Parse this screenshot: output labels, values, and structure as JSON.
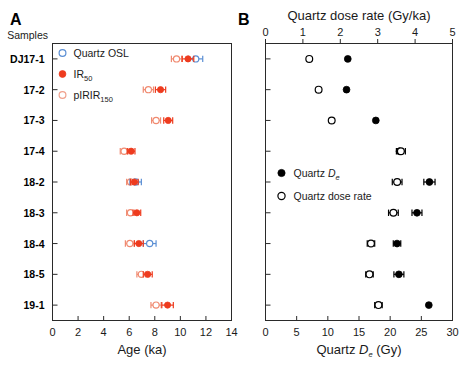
{
  "figure": {
    "width": 467,
    "height": 369,
    "background": "#ffffff"
  },
  "panelA": {
    "letter": "A",
    "samples_header": "Samples",
    "xlabel": "Age (ka)",
    "xticks": [
      "0",
      "2",
      "4",
      "6",
      "8",
      "10",
      "12",
      "14"
    ],
    "xtick_values": [
      0,
      2,
      4,
      6,
      8,
      10,
      12,
      14
    ],
    "xlim": [
      0,
      14
    ],
    "categories": [
      "DJ17-1",
      "17-2",
      "17-3",
      "17-4",
      "18-2",
      "18-3",
      "18-4",
      "18-5",
      "19-1"
    ],
    "legend": [
      {
        "label": "Quartz OSL",
        "marker": "open-circle",
        "color": "#5b8fd4"
      },
      {
        "label": "IR",
        "sub": "50",
        "marker": "filled-circle",
        "color": "#ee3b1e"
      },
      {
        "label": "pIRIR",
        "sub": "150",
        "marker": "open-circle",
        "color": "#f0a08c"
      }
    ],
    "colors": {
      "quartz_osl": "#5b8fd4",
      "ir50": "#ee3b1e",
      "pirir150": "#f08a70"
    }
  },
  "panelB": {
    "letter": "B",
    "top_axis_title": "Quartz dose rate (Gy/ka)",
    "bottom_axis_title_prefix": "Quartz ",
    "bottom_axis_title_symbol": "D",
    "bottom_axis_title_sub": "e",
    "bottom_axis_title_suffix": " (Gy)",
    "top_xticks": [
      "0",
      "1",
      "2",
      "3",
      "4",
      "5"
    ],
    "top_xtick_values": [
      0,
      1,
      2,
      3,
      4,
      5
    ],
    "top_xlim": [
      0,
      5
    ],
    "bottom_xticks": [
      "0",
      "5",
      "10",
      "15",
      "20",
      "25",
      "30"
    ],
    "bottom_xtick_values": [
      0,
      5,
      10,
      15,
      20,
      25,
      30
    ],
    "bottom_xlim": [
      0,
      30
    ],
    "categories": [
      "DJ17-1",
      "17-2",
      "17-3",
      "17-4",
      "18-2",
      "18-3",
      "18-4",
      "18-5",
      "19-1"
    ],
    "legend": [
      {
        "label_prefix": "Quartz ",
        "label_symbol": "D",
        "label_sub": "e",
        "marker": "filled-circle",
        "color": "#000000"
      },
      {
        "label_prefix": "Quartz dose rate",
        "label_symbol": "",
        "label_sub": "",
        "marker": "open-circle",
        "color": "#000000"
      }
    ]
  },
  "chart_data": [
    {
      "type": "scatter",
      "panel": "A",
      "title": "",
      "xlabel": "Age (ka)",
      "ylabel": "Samples",
      "xlim": [
        0,
        14
      ],
      "grid": false,
      "legend_position": "upper-left-inside",
      "categories": [
        "DJ17-1",
        "17-2",
        "17-3",
        "17-4",
        "18-2",
        "18-3",
        "18-4",
        "18-5",
        "19-1"
      ],
      "series": [
        {
          "name": "Quartz OSL",
          "marker": "open-circle",
          "color": "#5b8fd4",
          "values": [
            11.2,
            null,
            null,
            null,
            6.5,
            null,
            7.6,
            null,
            null
          ],
          "errors": [
            0.55,
            null,
            null,
            null,
            0.45,
            null,
            0.5,
            null,
            null
          ]
        },
        {
          "name": "IR50",
          "marker": "filled-circle",
          "color": "#ee3b1e",
          "values": [
            10.6,
            8.45,
            9.05,
            6.15,
            6.4,
            6.6,
            6.75,
            7.45,
            9.0
          ],
          "errors": [
            0.45,
            0.4,
            0.35,
            0.3,
            0.3,
            0.3,
            0.35,
            0.35,
            0.45
          ]
        },
        {
          "name": "pIRIR150",
          "marker": "open-circle",
          "color": "#f08a70",
          "values": [
            9.7,
            7.5,
            8.1,
            5.6,
            6.1,
            6.1,
            6.05,
            6.95,
            8.1
          ],
          "errors": [
            0.4,
            0.4,
            0.35,
            0.3,
            0.3,
            0.3,
            0.35,
            0.35,
            0.4
          ]
        }
      ]
    },
    {
      "type": "scatter",
      "panel": "B",
      "title": "",
      "xlabel": "Quartz De (Gy)",
      "xlabel_top": "Quartz dose rate (Gy/ka)",
      "ylabel": "",
      "xlim": [
        0,
        30
      ],
      "xlim_top": [
        0,
        5
      ],
      "grid": false,
      "legend_position": "center-left-inside",
      "categories": [
        "DJ17-1",
        "17-2",
        "17-3",
        "17-4",
        "18-2",
        "18-3",
        "18-4",
        "18-5",
        "19-1"
      ],
      "series": [
        {
          "name": "Quartz De",
          "axis": "bottom",
          "unit": "Gy",
          "marker": "filled-circle",
          "color": "#000000",
          "values": [
            13.2,
            13.0,
            17.7,
            21.5,
            26.3,
            24.3,
            21.1,
            21.4,
            26.2
          ],
          "errors": [
            0.0,
            0.0,
            0.0,
            0.0,
            0.9,
            0.8,
            0.6,
            0.8,
            0.0
          ]
        },
        {
          "name": "Quartz dose rate",
          "axis": "top",
          "unit": "Gy/ka",
          "marker": "open-circle",
          "color": "#000000",
          "values": [
            1.17,
            1.42,
            1.77,
            3.62,
            3.52,
            3.42,
            2.82,
            2.78,
            3.02
          ],
          "errors": [
            0.0,
            0.0,
            0.0,
            0.12,
            0.13,
            0.13,
            0.1,
            0.1,
            0.1
          ]
        }
      ]
    }
  ]
}
